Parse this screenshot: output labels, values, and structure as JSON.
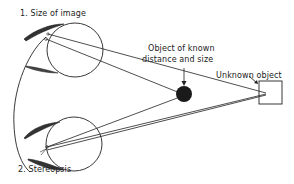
{
  "diagram": {
    "labels": {
      "size_of_image": "1. Size of image",
      "stereopsis": "2. Stereopsis",
      "known_object_line1": "Object of known",
      "known_object_line2": "distance and size",
      "unknown_object": "Unknown object"
    },
    "colors": {
      "ink": "#222222",
      "background": "#ffffff",
      "known_object_fill": "#1a1a1a"
    },
    "elements": {
      "eyes": [
        "top-eye",
        "bottom-eye"
      ],
      "known_object_shape": "filled-circle",
      "unknown_object_shape": "square"
    }
  }
}
